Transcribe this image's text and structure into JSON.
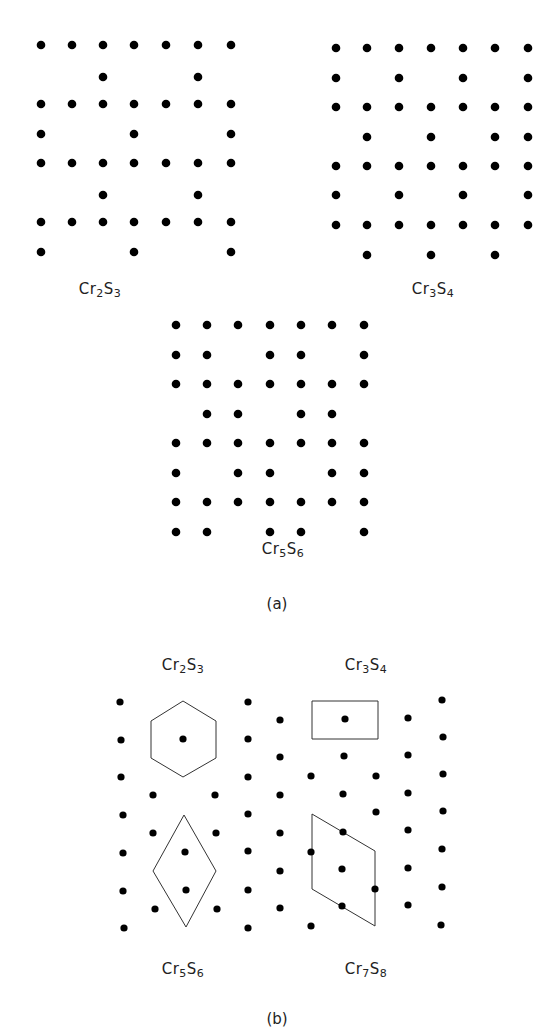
{
  "figure": {
    "part_a": {
      "caption": "(a)",
      "panels": [
        {
          "id": "cr2s3",
          "formula": {
            "el1": "Cr",
            "n1": "2",
            "el2": "S",
            "n2": "3"
          },
          "label_pos": [
            100,
            290
          ],
          "cols_x": [
            41,
            72,
            103,
            134,
            166,
            198,
            231
          ],
          "rows_y": [
            45,
            77,
            104,
            134,
            163,
            195,
            222,
            252
          ],
          "occupancy": [
            [
              0,
              1,
              2,
              3,
              4,
              5,
              6
            ],
            [
              2,
              5
            ],
            [
              0,
              1,
              2,
              3,
              4,
              5,
              6
            ],
            [
              0,
              3,
              6
            ],
            [
              0,
              1,
              2,
              3,
              4,
              5,
              6
            ],
            [
              2,
              5
            ],
            [
              0,
              1,
              2,
              3,
              4,
              5,
              6
            ],
            [
              0,
              3,
              6
            ]
          ]
        },
        {
          "id": "cr3s4",
          "formula": {
            "el1": "Cr",
            "n1": "3",
            "el2": "S",
            "n2": "4"
          },
          "label_pos": [
            433,
            290
          ],
          "cols_x": [
            336,
            367,
            399,
            431,
            463,
            495,
            528
          ],
          "rows_y": [
            48,
            78,
            107,
            137,
            166,
            195,
            225,
            255
          ],
          "occupancy": [
            [
              0,
              1,
              2,
              3,
              4,
              5,
              6
            ],
            [
              0,
              2,
              4,
              6
            ],
            [
              0,
              1,
              2,
              3,
              4,
              5,
              6
            ],
            [
              1,
              3,
              5,
              6
            ],
            [
              0,
              1,
              2,
              3,
              4,
              5,
              6
            ],
            [
              0,
              2,
              4,
              6
            ],
            [
              0,
              1,
              2,
              3,
              4,
              5,
              6
            ],
            [
              1,
              3,
              5
            ]
          ]
        },
        {
          "id": "cr5s6",
          "formula": {
            "el1": "Cr",
            "n1": "5",
            "el2": "S",
            "n2": "6"
          },
          "label_pos": [
            283,
            550
          ],
          "cols_x": [
            176,
            207,
            238,
            270,
            301,
            332,
            364
          ],
          "rows_y": [
            325,
            355,
            384,
            414,
            443,
            473,
            502,
            532
          ],
          "occupancy": [
            [
              0,
              1,
              2,
              3,
              4,
              5,
              6
            ],
            [
              0,
              1,
              3,
              4,
              6
            ],
            [
              0,
              1,
              2,
              3,
              4,
              5,
              6
            ],
            [
              1,
              2,
              4,
              5
            ],
            [
              0,
              1,
              2,
              3,
              4,
              5,
              6
            ],
            [
              0,
              2,
              3,
              5,
              6
            ],
            [
              0,
              1,
              2,
              3,
              4,
              5,
              6
            ],
            [
              0,
              1,
              3,
              4,
              6
            ]
          ]
        }
      ],
      "caption_pos": [
        277,
        605
      ]
    },
    "part_b": {
      "caption": "(b)",
      "caption_pos": [
        277,
        1020
      ],
      "labels": [
        {
          "formula": {
            "el1": "Cr",
            "n1": "2",
            "el2": "S",
            "n2": "3"
          },
          "pos": [
            183,
            666
          ]
        },
        {
          "formula": {
            "el1": "Cr",
            "n1": "3",
            "el2": "S",
            "n2": "4"
          },
          "pos": [
            366,
            666
          ]
        },
        {
          "formula": {
            "el1": "Cr",
            "n1": "5",
            "el2": "S",
            "n2": "6"
          },
          "pos": [
            183,
            970
          ]
        },
        {
          "formula": {
            "el1": "Cr",
            "n1": "7",
            "el2": "S",
            "n2": "8"
          },
          "pos": [
            366,
            970
          ]
        }
      ],
      "dots": [
        [
          120,
          702
        ],
        [
          121,
          740
        ],
        [
          121,
          777
        ],
        [
          123,
          815
        ],
        [
          123,
          853
        ],
        [
          123,
          891
        ],
        [
          124,
          928
        ],
        [
          153,
          795
        ],
        [
          153,
          833
        ],
        [
          155,
          909
        ],
        [
          183,
          739
        ],
        [
          185,
          852
        ],
        [
          186,
          890
        ],
        [
          215,
          795
        ],
        [
          216,
          833
        ],
        [
          217,
          909
        ],
        [
          248,
          702
        ],
        [
          248,
          739
        ],
        [
          248,
          777
        ],
        [
          248,
          814
        ],
        [
          248,
          851
        ],
        [
          248,
          890
        ],
        [
          248,
          928
        ],
        [
          280,
          720
        ],
        [
          280,
          757
        ],
        [
          280,
          795
        ],
        [
          280,
          833
        ],
        [
          280,
          871
        ],
        [
          280,
          908
        ],
        [
          311,
          776
        ],
        [
          311,
          852
        ],
        [
          311,
          926
        ],
        [
          345,
          719
        ],
        [
          344,
          756
        ],
        [
          343,
          794
        ],
        [
          343,
          832
        ],
        [
          342,
          869
        ],
        [
          342,
          906
        ],
        [
          376,
          776
        ],
        [
          376,
          812
        ],
        [
          375,
          889
        ],
        [
          408,
          718
        ],
        [
          408,
          755
        ],
        [
          408,
          793
        ],
        [
          408,
          830
        ],
        [
          408,
          868
        ],
        [
          408,
          905
        ],
        [
          442,
          700
        ],
        [
          443,
          737
        ],
        [
          443,
          774
        ],
        [
          443,
          811
        ],
        [
          442,
          849
        ],
        [
          442,
          887
        ],
        [
          441,
          925
        ]
      ],
      "shapes": [
        {
          "name": "hexagon-cr2s3",
          "points": "183,701 216,721 216,758 183,777 151,758 151,721"
        },
        {
          "name": "rhombus-cr5s6",
          "points": "184,815 216,871 186,927 153,871"
        },
        {
          "name": "rectangle-cr3s4",
          "points": "312,701 378,701 378,739 312,739"
        },
        {
          "name": "parallelogram-cr7s8",
          "points": "312,814 375,851 375,926 312,889"
        }
      ]
    }
  }
}
